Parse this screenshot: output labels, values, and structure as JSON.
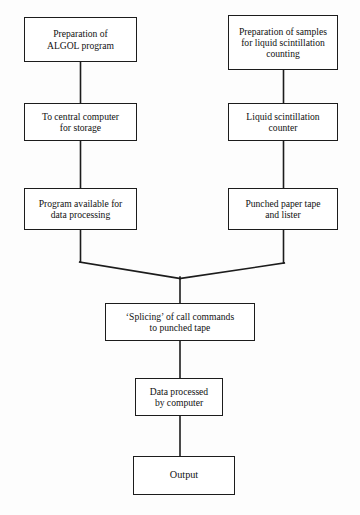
{
  "diagram": {
    "type": "flowchart",
    "colors": {
      "background": "#fdfdfd",
      "box_fill": "#ffffff",
      "stroke": "#1c1c1c",
      "text": "#111111"
    },
    "nodes": [
      {
        "id": "algol-prep",
        "text": "Preparation of\nALGOL program",
        "branch": "left",
        "row": 1
      },
      {
        "id": "sample-prep",
        "text": "Preparation of samples\nfor liquid scintillation\ncounting",
        "branch": "right",
        "row": 1
      },
      {
        "id": "central-comp",
        "text": "To central computer\nfor storage",
        "branch": "left",
        "row": 2
      },
      {
        "id": "ls-counter",
        "text": "Liquid scintillation\ncounter",
        "branch": "right",
        "row": 2
      },
      {
        "id": "program-avail",
        "text": "Program available for\ndata processing",
        "branch": "left",
        "row": 3
      },
      {
        "id": "paper-tape",
        "text": "Punched paper tape\nand lister",
        "branch": "right",
        "row": 3
      },
      {
        "id": "splicing",
        "text": "‘Splicing’ of call commands\nto punched tape",
        "branch": "merged",
        "row": 4
      },
      {
        "id": "data-processed",
        "text": "Data processed\nby computer",
        "branch": "merged",
        "row": 5
      },
      {
        "id": "output",
        "text": "Output",
        "branch": "merged",
        "row": 6
      }
    ],
    "edges": [
      {
        "id": "edge-algol-to-central",
        "from": "algol-prep",
        "to": "central-comp",
        "style": "vertical"
      },
      {
        "id": "edge-central-to-program",
        "from": "central-comp",
        "to": "program-avail",
        "style": "vertical"
      },
      {
        "id": "edge-sample-to-counter",
        "from": "sample-prep",
        "to": "ls-counter",
        "style": "vertical"
      },
      {
        "id": "edge-counter-to-tape",
        "from": "ls-counter",
        "to": "paper-tape",
        "style": "vertical"
      },
      {
        "id": "edge-program-to-splicing",
        "from": "program-avail",
        "to": "splicing",
        "style": "elbow-merge"
      },
      {
        "id": "edge-tape-to-splicing",
        "from": "paper-tape",
        "to": "splicing",
        "style": "elbow-merge"
      },
      {
        "id": "edge-splicing-to-data",
        "from": "splicing",
        "to": "data-processed",
        "style": "vertical"
      },
      {
        "id": "edge-data-to-output",
        "from": "data-processed",
        "to": "output",
        "style": "vertical"
      }
    ]
  }
}
